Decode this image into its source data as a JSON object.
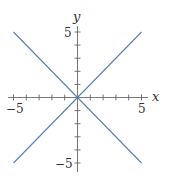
{
  "chart_data": {
    "type": "line",
    "title": "",
    "xlabel": "x",
    "ylabel": "y",
    "xlim": [
      -5,
      5
    ],
    "ylim": [
      -5,
      5
    ],
    "grid": false,
    "legend": null,
    "x_ticks": [
      -5,
      -4,
      -3,
      -2,
      -1,
      0,
      1,
      2,
      3,
      4,
      5
    ],
    "y_ticks": [
      -5,
      -4,
      -3,
      -2,
      -1,
      0,
      1,
      2,
      3,
      4,
      5
    ],
    "x_tick_labels": [
      {
        "value": -5,
        "label": "−5"
      },
      {
        "value": 5,
        "label": "5"
      }
    ],
    "y_tick_labels": [
      {
        "value": 5,
        "label": "5"
      },
      {
        "value": -5,
        "label": "−5"
      }
    ],
    "series": [
      {
        "name": "y = x",
        "x": [
          -5,
          5
        ],
        "y": [
          -5,
          5
        ],
        "color": "#5b7fb0"
      },
      {
        "name": "y = -x",
        "x": [
          -5,
          5
        ],
        "y": [
          5,
          -5
        ],
        "color": "#5b7fb0"
      }
    ]
  },
  "labels": {
    "x_axis": "x",
    "y_axis": "y",
    "x_min": "−5",
    "x_max": "5",
    "y_max": "5",
    "y_min": "−5"
  },
  "colors": {
    "axis": "#555555",
    "line": "#5b7fb0"
  }
}
